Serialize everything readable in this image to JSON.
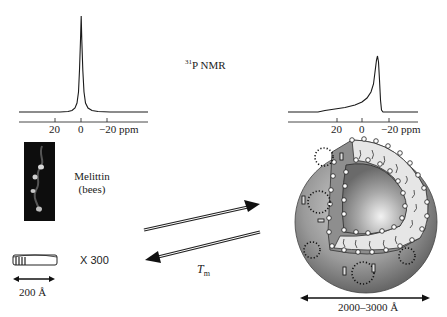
{
  "title": "31P NMR",
  "title_sup": "31",
  "title_main": "P NMR",
  "left_spectrum": {
    "axis_ticks": [
      "20",
      "0",
      "−20 ppm"
    ],
    "peak_ppm": 0,
    "shape": "narrow isotropic"
  },
  "right_spectrum": {
    "axis_ticks": [
      "20",
      "0",
      "−20 ppm"
    ],
    "peak_ppm": -12,
    "shape": "axially symmetric powder pattern"
  },
  "melittin": {
    "name": "Melittin",
    "source": "(bees)"
  },
  "bicelle": {
    "multiplier": "X 300",
    "size": "200 Å"
  },
  "vesicle": {
    "size": "2000–3000 Å"
  },
  "transition": {
    "label_T": "T",
    "label_sub": "m"
  }
}
